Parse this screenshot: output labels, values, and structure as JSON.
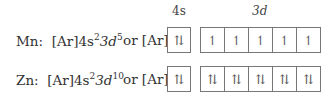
{
  "headers": {
    "s": "4s",
    "d": "3d"
  },
  "rows": [
    {
      "element": "Mn",
      "config_prefix": "[Ar]4s",
      "s_exp": "2",
      "d_part": "3d",
      "d_exp": "5",
      "or_text": "or [Ar]",
      "s_orbital": "⇅",
      "d_orbitals": [
        "↿",
        "↿",
        "↿",
        "↿",
        "↿"
      ]
    },
    {
      "element": "Zn",
      "config_prefix": "[Ar]4s",
      "s_exp": "2",
      "d_part": "3d",
      "d_exp": "10",
      "or_text": "or [Ar]",
      "s_orbital": "⇅",
      "d_orbitals": [
        "⇅",
        "⇅",
        "⇅",
        "⇅",
        "⇅"
      ]
    }
  ]
}
